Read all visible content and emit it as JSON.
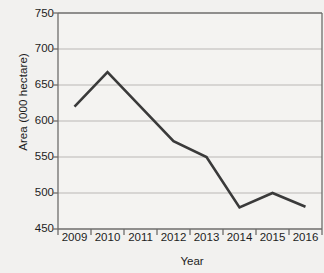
{
  "chart_data": {
    "type": "line",
    "title": "",
    "xlabel": "Year",
    "ylabel": "Area (000 hectare)",
    "categories": [
      "2009",
      "2010",
      "2011",
      "2012",
      "2013",
      "2014",
      "2015",
      "2016"
    ],
    "values": [
      620,
      668,
      620,
      572,
      550,
      480,
      500,
      481
    ],
    "series": [
      {
        "name": "Area",
        "values": [
          620,
          668,
          620,
          572,
          550,
          480,
          500,
          481
        ]
      }
    ],
    "ylim": [
      450,
      750
    ],
    "yticks": [
      450,
      500,
      550,
      600,
      650,
      700,
      750
    ],
    "grid": true,
    "legend": "none",
    "line_color": "#3a3a3a",
    "grid_color": "#b9b8b6",
    "background_color": "#f2f1ef",
    "plot_border_color": "#6e6d6b"
  }
}
